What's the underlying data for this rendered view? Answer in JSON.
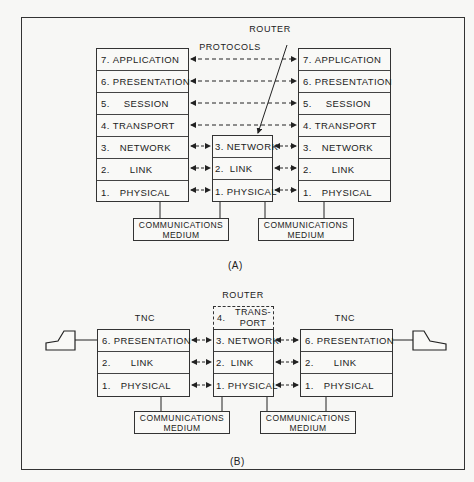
{
  "diagram_a": {
    "caption": "(A)",
    "router_label": "ROUTER",
    "protocols_label": "PROTOCOLS",
    "left_stack": [
      {
        "num": "7.",
        "label": "APPLICATION"
      },
      {
        "num": "6.",
        "label": "PRESENTATION"
      },
      {
        "num": "5.",
        "label": "SESSION"
      },
      {
        "num": "4.",
        "label": "TRANSPORT"
      },
      {
        "num": "3.",
        "label": "NETWORK"
      },
      {
        "num": "2.",
        "label": "LINK"
      },
      {
        "num": "1.",
        "label": "PHYSICAL"
      }
    ],
    "router_stack": [
      {
        "num": "3.",
        "label": "NETWORK"
      },
      {
        "num": "2.",
        "label": "LINK"
      },
      {
        "num": "1.",
        "label": "PHYSICAL"
      }
    ],
    "right_stack": [
      {
        "num": "7.",
        "label": "APPLICATION"
      },
      {
        "num": "6.",
        "label": "PRESENTATION"
      },
      {
        "num": "5.",
        "label": "SESSION"
      },
      {
        "num": "4.",
        "label": "TRANSPORT"
      },
      {
        "num": "3.",
        "label": "NETWORK"
      },
      {
        "num": "2.",
        "label": "LINK"
      },
      {
        "num": "1.",
        "label": "PHYSICAL"
      }
    ],
    "medium_left": {
      "line1": "COMMUNICATIONS",
      "line2": "MEDIUM"
    },
    "medium_right": {
      "line1": "COMMUNICATIONS",
      "line2": "MEDIUM"
    }
  },
  "diagram_b": {
    "caption": "(B)",
    "router_label": "ROUTER",
    "left_tnc_label": "TNC",
    "right_tnc_label": "TNC",
    "router_optional": {
      "num": "4.",
      "line1": "TRANS-",
      "line2": "PORT"
    },
    "left_stack": [
      {
        "num": "6.",
        "label": "PRESENTATION"
      },
      {
        "num": "2.",
        "label": "LINK"
      },
      {
        "num": "1.",
        "label": "PHYSICAL"
      }
    ],
    "router_stack": [
      {
        "num": "3.",
        "label": "NETWORK"
      },
      {
        "num": "2.",
        "label": "LINK"
      },
      {
        "num": "1.",
        "label": "PHYSICAL"
      }
    ],
    "right_stack": [
      {
        "num": "6.",
        "label": "PRESENTATION"
      },
      {
        "num": "2.",
        "label": "LINK"
      },
      {
        "num": "1.",
        "label": "PHYSICAL"
      }
    ],
    "medium_left": {
      "line1": "COMMUNICATIONS",
      "line2": "MEDIUM"
    },
    "medium_right": {
      "line1": "COMMUNICATIONS",
      "line2": "MEDIUM"
    },
    "terminals": [
      "terminal-icon",
      "terminal-icon"
    ]
  }
}
